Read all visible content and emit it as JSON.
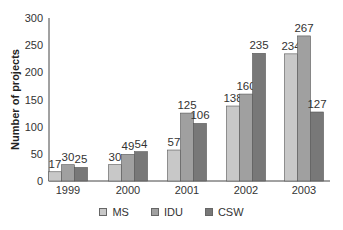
{
  "chart_data": {
    "type": "bar",
    "title": "",
    "xlabel": "",
    "ylabel": "Number of projects",
    "ylim": [
      0,
      300
    ],
    "yticks": [
      0,
      50,
      100,
      150,
      200,
      250,
      300
    ],
    "grid": false,
    "legend_position": "bottom",
    "categories": [
      "1999",
      "2000",
      "2001",
      "2002",
      "2003"
    ],
    "series": [
      {
        "name": "MS",
        "color": "#c8c8c8",
        "values": [
          17,
          30,
          57,
          138,
          234
        ]
      },
      {
        "name": "IDU",
        "color": "#a0a0a0",
        "values": [
          30,
          49,
          125,
          160,
          267
        ]
      },
      {
        "name": "CSW",
        "color": "#787878",
        "values": [
          25,
          54,
          106,
          235,
          127
        ]
      }
    ]
  }
}
